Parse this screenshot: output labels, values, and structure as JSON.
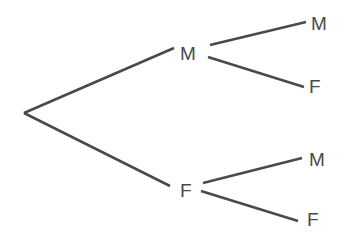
{
  "diagram": {
    "type": "tree",
    "root": "",
    "levels": [
      [
        "M",
        "F"
      ],
      [
        "M",
        "F",
        "M",
        "F"
      ]
    ],
    "nodes": {
      "level1_top": "M",
      "level1_bottom": "F",
      "level2_top_top": "M",
      "level2_top_bottom": "F",
      "level2_bottom_top": "M",
      "level2_bottom_bottom": "F"
    },
    "line_color": "#4a4a4a"
  }
}
